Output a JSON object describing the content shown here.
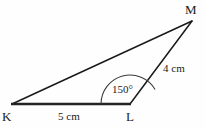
{
  "figure": {
    "type": "triangle-diagram",
    "background_color": "#fefefe",
    "stroke_color": "#1a1a1a",
    "vertices": [
      {
        "name": "K",
        "label": "K",
        "x": 12,
        "y": 104
      },
      {
        "name": "L",
        "label": "L",
        "x": 130,
        "y": 104
      },
      {
        "name": "M",
        "label": "M",
        "x": 192,
        "y": 21
      }
    ],
    "edges": [
      {
        "name": "KL",
        "from": "K",
        "to": "L",
        "length_label": "5 cm",
        "stroke_width": 2.2
      },
      {
        "name": "LM",
        "from": "L",
        "to": "M",
        "length_label": "4 cm",
        "stroke_width": 1.4
      },
      {
        "name": "KM",
        "from": "K",
        "to": "M",
        "length_label": "",
        "stroke_width": 1.4
      }
    ],
    "angle": {
      "at_vertex": "L",
      "label": "150°",
      "value": 150,
      "unit": "degrees",
      "arc_radius": 29,
      "arc_start_x": 101,
      "arc_start_y": 104,
      "arc_end_x": 151,
      "arc_end_y": 89
    },
    "labels": {
      "vertex_k": "K",
      "vertex_l": "L",
      "vertex_m": "M",
      "side_kl": "5 cm",
      "side_lm": "4 cm",
      "angle_l": "150°"
    }
  }
}
